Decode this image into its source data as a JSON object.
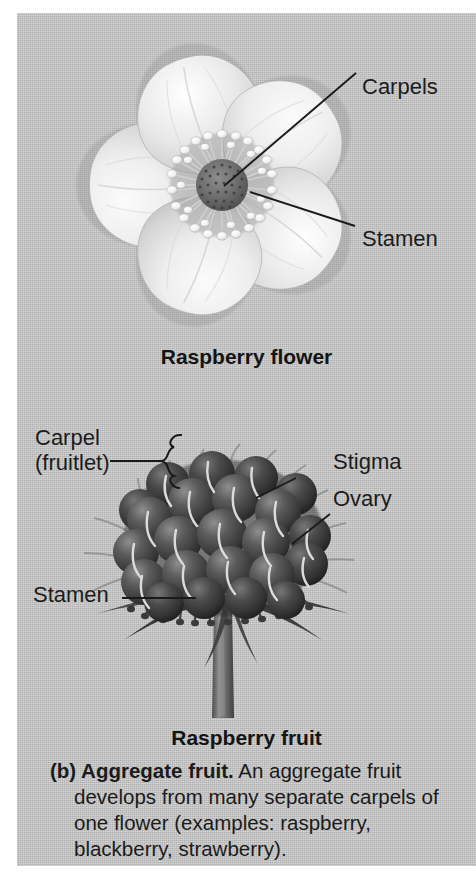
{
  "figure": {
    "panel_bg": "#c3c3c3",
    "text_color": "#1b1b1b",
    "line_color": "#1a1a1a"
  },
  "flower_panel": {
    "title": "Raspberry flower",
    "labels": [
      {
        "id": "carpels",
        "text": "Carpels"
      },
      {
        "id": "stamen",
        "text": "Stamen"
      }
    ],
    "illustration": {
      "name": "raspberry-flower-illustration",
      "petal_count": 5,
      "petal_color": "#ededed",
      "receptacle_color": "#6a6a6a",
      "anther_color": "#f2f2f2"
    }
  },
  "fruit_panel": {
    "title": "Raspberry fruit",
    "labels": [
      {
        "id": "carpel-fruitlet",
        "line1": "Carpel",
        "line2": "(fruitlet)"
      },
      {
        "id": "stigma",
        "text": "Stigma"
      },
      {
        "id": "ovary",
        "text": "Ovary"
      },
      {
        "id": "stamen",
        "text": "Stamen"
      }
    ],
    "illustration": {
      "name": "raspberry-fruit-illustration",
      "drupelet_color": "#4d4d4d",
      "sepal_color": "#5c5c5c",
      "stem_color": "#6b6b6b",
      "stigma_color": "#d8d8d8"
    }
  },
  "caption": {
    "lead": "(b) Aggregate fruit.",
    "body": " An aggregate fruit develops from many separate carpels of one flower (examples: raspberry, blackberry, strawberry)."
  }
}
